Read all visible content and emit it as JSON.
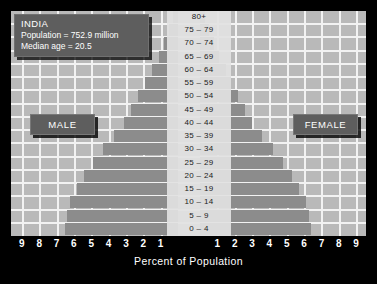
{
  "info": {
    "country": "INDIA",
    "population": "Population = 752.9 million",
    "median_age": "Median age = 20.5"
  },
  "legend": {
    "male": "MALE",
    "female": "FEMALE"
  },
  "axis": {
    "title": "Percent of Population",
    "ticks_left": [
      "9",
      "8",
      "7",
      "6",
      "5",
      "4",
      "3",
      "2",
      "1"
    ],
    "ticks_right": [
      "1",
      "2",
      "3",
      "4",
      "5",
      "6",
      "7",
      "8",
      "9"
    ]
  },
  "colors": {
    "background": "#000000",
    "plot": "#b9b9b9",
    "gridline": "#f2f2f2",
    "bar": "#8c8c8c",
    "box": "#5e5e5e",
    "text_light": "#ffffff",
    "text_dark": "#1a1a1a"
  },
  "chart_data": {
    "type": "bar",
    "title": "INDIA",
    "subtitle": "Population = 752.9 million; Median age = 20.5",
    "xlabel": "Percent of Population",
    "ylabel": "Age group",
    "orientation": "population-pyramid",
    "xlim": [
      0,
      9.5
    ],
    "grid": true,
    "legend_position": "inside-left-and-right",
    "categories": [
      "80+",
      "75 – 79",
      "70 – 74",
      "65 – 69",
      "60 – 64",
      "55 – 59",
      "50 – 54",
      "45 – 49",
      "40 – 44",
      "35 – 39",
      "30 – 34",
      "25 – 29",
      "20 – 24",
      "15 – 19",
      "10 – 14",
      "5 – 9",
      "0 – 4"
    ],
    "series": [
      {
        "name": "MALE",
        "side": "left",
        "values": [
          0.3,
          0.5,
          0.8,
          1.1,
          1.5,
          1.9,
          2.3,
          2.7,
          3.1,
          3.7,
          4.3,
          4.9,
          5.4,
          5.8,
          6.2,
          6.4,
          6.5
        ]
      },
      {
        "name": "FEMALE",
        "side": "right",
        "values": [
          0.3,
          0.5,
          0.8,
          1.1,
          1.5,
          1.8,
          2.2,
          2.6,
          3.0,
          3.6,
          4.2,
          4.8,
          5.3,
          5.7,
          6.1,
          6.3,
          6.4
        ]
      }
    ]
  }
}
